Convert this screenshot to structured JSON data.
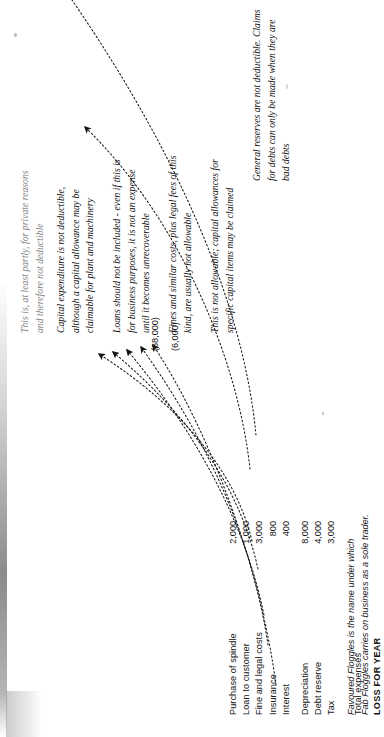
{
  "document": {
    "kind": "scanned-book-page",
    "orientation": "rotated-90-ccw",
    "ink_color": "#141414"
  },
  "statement": {
    "rows": [
      {
        "label": "Purchase of spindle",
        "amount": "2,000"
      },
      {
        "label": "Loan to customer",
        "amount": "1,000"
      },
      {
        "label": "Fine and legal costs",
        "amount": "3,000"
      },
      {
        "label": "Insurance",
        "amount": "800"
      },
      {
        "label": "Interest",
        "amount": "400"
      },
      {
        "label": "Depreciation",
        "amount": "8,000"
      },
      {
        "label": "Debt reserve",
        "amount": "4,000"
      },
      {
        "label": "Tax",
        "amount": "3,000"
      }
    ],
    "totals": [
      {
        "label": "Total expenses",
        "amount": "(68,000)",
        "bold": false
      },
      {
        "label": "LOSS FOR YEAR",
        "amount": "(6,000)",
        "bold": true
      }
    ]
  },
  "footnote": {
    "line1": "Favoured Floggles  is  the name under which",
    "line2": "Fab Floggles carries on business as a sole trader."
  },
  "annotations": [
    {
      "id": "private-reasons",
      "text": "This is, at least partly, for private reasons\nand therefore not deductible",
      "clipped_at_top": true
    },
    {
      "id": "capital-expenditure",
      "text": "Capital expenditure is not deductible,\nalthough a capital allowance may be\nclaimable for plant and machinery"
    },
    {
      "id": "loans-not-expense",
      "text": "Loans should not be included - even if this is\nfor business purposes, it is not an expense\nuntil it becomes unrecoverable"
    },
    {
      "id": "fines-not-allowable",
      "text": "Fines and similar costs, plus legal fees of this\nkind, are usually not allowable"
    },
    {
      "id": "depreciation-not-allowable",
      "text": "This is not allowable; capital allowances for\nspecific capital items may be claimed"
    },
    {
      "id": "general-reserves",
      "text": "General reserves are not deductible. Claims\nfor debts can only be made when they are\nbad debts"
    }
  ]
}
